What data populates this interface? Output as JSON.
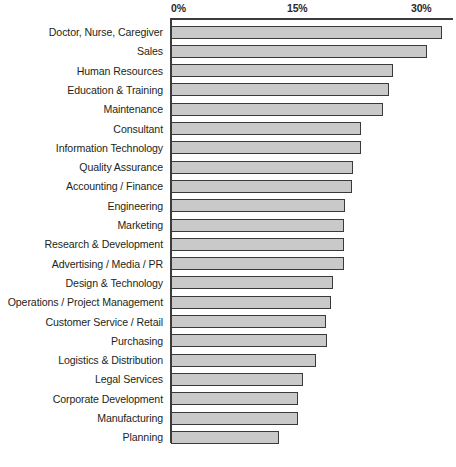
{
  "chart_data": {
    "type": "bar",
    "orientation": "horizontal",
    "title": "",
    "subtitle": "",
    "xlabel": "",
    "ylabel": "",
    "xlim": [
      0,
      33.5
    ],
    "xticks": [
      0,
      15,
      30
    ],
    "xticklabels": [
      "0%",
      "15%",
      "30%"
    ],
    "grid": false,
    "legend": null,
    "bar_color": "#c9c9c9",
    "bar_edge_color": "#3a3a3a",
    "axis_color": "#3c3c3c",
    "text_color": "#231f20",
    "categories": [
      "Doctor, Nurse, Caregiver",
      "Sales",
      "Human Resources",
      "Education & Training",
      "Maintenance",
      "Consultant",
      "Information Technology",
      "Quality Assurance",
      "Accounting / Finance",
      "Engineering",
      "Marketing",
      "Research & Development",
      "Advertising / Media / PR",
      "Design & Technology",
      "Operations / Project Management",
      "Customer Service / Retail",
      "Purchasing",
      "Logistics & Distribution",
      "Legal Services",
      "Corporate Development",
      "Manufacturing",
      "Planning"
    ],
    "values": [
      32.8,
      31.0,
      26.9,
      26.4,
      25.6,
      23.0,
      23.0,
      22.0,
      21.9,
      21.0,
      20.9,
      20.9,
      20.9,
      19.6,
      19.3,
      18.7,
      18.9,
      17.5,
      16.0,
      15.4,
      15.4,
      13.1
    ]
  }
}
